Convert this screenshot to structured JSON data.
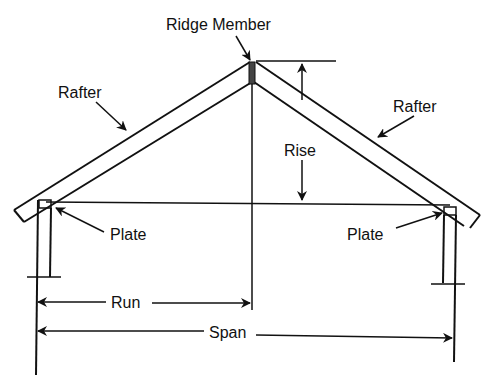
{
  "diagram": {
    "labels": {
      "ridge_member": "Ridge Member",
      "rafter_left": "Rafter",
      "rafter_right": "Rafter",
      "rise": "Rise",
      "plate_left": "Plate",
      "plate_right": "Plate",
      "run": "Run",
      "span": "Span"
    },
    "colors": {
      "line": "#111111",
      "background": "#ffffff"
    }
  }
}
